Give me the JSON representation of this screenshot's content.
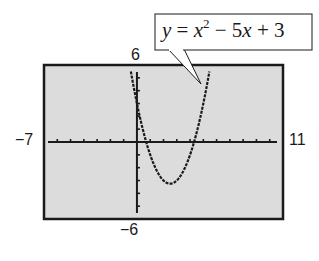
{
  "chart_data": {
    "type": "line",
    "title": "",
    "equation": {
      "y": "y",
      "eq": "=",
      "x": "x",
      "exp": "2",
      "rest1": "− 5",
      "x2": "x",
      "rest2": "+ 3",
      "full": "y = x^2 − 5x + 3"
    },
    "function": {
      "a": 1,
      "b": -5,
      "c": 3
    },
    "window": {
      "xmin": -7,
      "xmax": 11,
      "ymin": -6,
      "ymax": 6,
      "xscl": 1,
      "yscl": 1
    },
    "labels": {
      "xmin": "−7",
      "xmax": "11",
      "ymin": "−6",
      "ymax": "6"
    },
    "xlabel": "",
    "ylabel": "",
    "grid": false,
    "style": "graphing-calculator-screen",
    "colors": {
      "screen": "#dcdcdc",
      "border": "#1a1a1a",
      "curve": "#1a1a1a"
    }
  }
}
